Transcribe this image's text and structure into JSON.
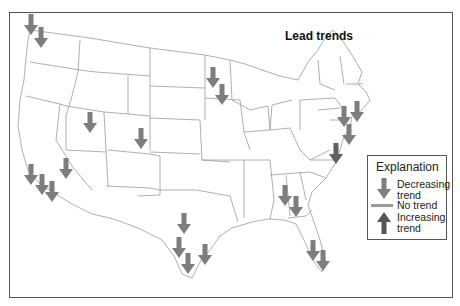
{
  "title": "Lead trends",
  "legend": {
    "title": "Explanation",
    "items": [
      {
        "label_line1": "Decreasing",
        "label_line2": "trend",
        "icon": "arrow-down-icon",
        "color": "#7f7f7f"
      },
      {
        "label_line1": "No trend",
        "label_line2": "",
        "icon": "dash-icon",
        "color": "#9a9a9a"
      },
      {
        "label_line1": "Increasing",
        "label_line2": "trend",
        "icon": "arrow-up-icon",
        "color": "#5a5a5a"
      }
    ]
  },
  "colors": {
    "decreasing": "#7d7d7d",
    "decreasing_dark": "#606060",
    "no_trend": "#9a9a9a",
    "increasing": "#555555",
    "state_lines": "#9a9a9a",
    "frame": "#555555"
  },
  "sites": [
    {
      "region": "Seattle area",
      "x": 31,
      "y": 14,
      "trend": "decreasing"
    },
    {
      "region": "Seattle area",
      "x": 41,
      "y": 27,
      "trend": "decreasing"
    },
    {
      "region": "Idaho/Oregon border",
      "x": 90,
      "y": 112,
      "trend": "decreasing"
    },
    {
      "region": "Colorado",
      "x": 141,
      "y": 128,
      "trend": "decreasing"
    },
    {
      "region": "Minnesota",
      "x": 213,
      "y": 67,
      "trend": "decreasing"
    },
    {
      "region": "Minnesota/Wisconsin",
      "x": 222,
      "y": 84,
      "trend": "decreasing"
    },
    {
      "region": "Nevada",
      "x": 66,
      "y": 158,
      "trend": "decreasing"
    },
    {
      "region": "Southern California",
      "x": 31,
      "y": 164,
      "trend": "decreasing"
    },
    {
      "region": "Southern California",
      "x": 42,
      "y": 174,
      "trend": "decreasing"
    },
    {
      "region": "Southern California",
      "x": 52,
      "y": 181,
      "trend": "decreasing"
    },
    {
      "region": "Texas",
      "x": 184,
      "y": 213,
      "trend": "decreasing"
    },
    {
      "region": "Texas",
      "x": 179,
      "y": 237,
      "trend": "decreasing"
    },
    {
      "region": "Texas",
      "x": 188,
      "y": 253,
      "trend": "decreasing"
    },
    {
      "region": "Texas Gulf coast",
      "x": 205,
      "y": 244,
      "trend": "decreasing"
    },
    {
      "region": "Georgia",
      "x": 285,
      "y": 185,
      "trend": "decreasing"
    },
    {
      "region": "Georgia",
      "x": 296,
      "y": 196,
      "trend": "decreasing"
    },
    {
      "region": "Florida",
      "x": 313,
      "y": 240,
      "trend": "decreasing"
    },
    {
      "region": "Florida",
      "x": 323,
      "y": 250,
      "trend": "decreasing"
    },
    {
      "region": "Northeast",
      "x": 344,
      "y": 106,
      "trend": "decreasing"
    },
    {
      "region": "New England",
      "x": 357,
      "y": 101,
      "trend": "decreasing"
    },
    {
      "region": "New Jersey",
      "x": 349,
      "y": 124,
      "trend": "decreasing"
    },
    {
      "region": "Chesapeake",
      "x": 336,
      "y": 143,
      "trend": "decreasing_dark"
    }
  ]
}
